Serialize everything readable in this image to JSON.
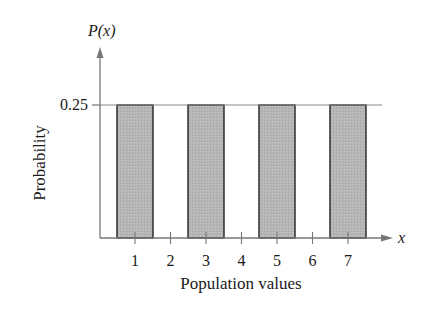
{
  "chart_data": {
    "type": "bar",
    "title": "",
    "xlabel": "Population values",
    "ylabel": "Probability",
    "y_axis_symbol": "P(x)",
    "x_axis_symbol": "x",
    "x_ticks": [
      "1",
      "2",
      "3",
      "4",
      "5",
      "6",
      "7"
    ],
    "y_ticks": [
      "0.25"
    ],
    "categories": [
      "1",
      "3",
      "5",
      "7"
    ],
    "values": [
      0.25,
      0.25,
      0.25,
      0.25
    ],
    "ylim": [
      0,
      0.3
    ],
    "xlim": [
      0.3,
      8
    ],
    "grid": false,
    "reference_line": 0.25,
    "legend": null
  },
  "colors": {
    "bar_fill": "#b3b3b3",
    "bar_stroke": "#222222",
    "axis": "#777777",
    "text": "#1a1a1a"
  }
}
